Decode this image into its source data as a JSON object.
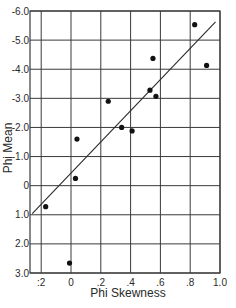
{
  "chart_data": {
    "type": "scatter",
    "title": "",
    "xlabel": "Phi Skewness",
    "ylabel": "Phi Mean",
    "xlim": [
      -0.27,
      1.0
    ],
    "ylim": [
      3.0,
      -6.0
    ],
    "y_inverted": true,
    "grid": true,
    "x_ticks": [
      -0.2,
      0,
      0.2,
      0.4,
      0.6,
      0.8,
      1.0
    ],
    "x_tick_labels": [
      ":2",
      "0",
      ".2",
      ".4",
      ".6",
      ".8",
      "1.0"
    ],
    "y_ticks": [
      -6,
      -5,
      -4,
      -3,
      -2,
      -1,
      0,
      1,
      2,
      3
    ],
    "y_tick_labels": [
      "-6.0",
      "-5.0",
      "-4.0",
      "-3.0",
      "-2.0",
      "-1.0",
      "0",
      "1.0",
      "2.0",
      "3.0"
    ],
    "points": [
      {
        "x": -0.17,
        "y": 0.72
      },
      {
        "x": -0.01,
        "y": 2.66
      },
      {
        "x": 0.03,
        "y": -0.25
      },
      {
        "x": 0.04,
        "y": -1.6
      },
      {
        "x": 0.25,
        "y": -2.9
      },
      {
        "x": 0.34,
        "y": -2.0
      },
      {
        "x": 0.41,
        "y": -1.88
      },
      {
        "x": 0.53,
        "y": -3.28
      },
      {
        "x": 0.55,
        "y": -4.37
      },
      {
        "x": 0.57,
        "y": -3.07
      },
      {
        "x": 0.83,
        "y": -5.53
      },
      {
        "x": 0.91,
        "y": -4.13
      }
    ],
    "regression_line": {
      "x1": -0.26,
      "y1": 0.96,
      "x2": 0.97,
      "y2": -5.63
    }
  },
  "style": {
    "line_color": "#2a2a2a",
    "grid_color": "#3a3a3a",
    "point_color": "#111111"
  }
}
